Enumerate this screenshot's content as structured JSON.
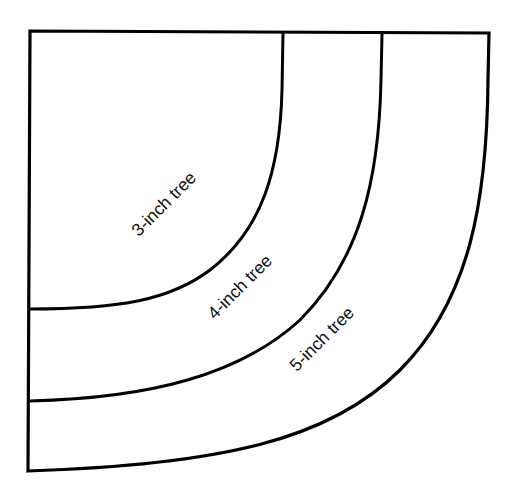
{
  "diagram": {
    "type": "quarter-circle tree skirt template",
    "stroke_color": "#000000",
    "background": "#ffffff",
    "labels": [
      {
        "text": "3-inch tree",
        "x": 168,
        "y": 208,
        "rotation": -45
      },
      {
        "text": "4-inch tree",
        "x": 244,
        "y": 291,
        "rotation": -45
      },
      {
        "text": "5-inch tree",
        "x": 326,
        "y": 343,
        "rotation": -45
      }
    ],
    "arcs": [
      {
        "name": "3-inch",
        "top_x": 283,
        "left_y": 309
      },
      {
        "name": "4-inch",
        "top_x": 382,
        "left_y": 401
      },
      {
        "name": "5-inch",
        "top_x": 489,
        "left_y": 471
      }
    ]
  }
}
